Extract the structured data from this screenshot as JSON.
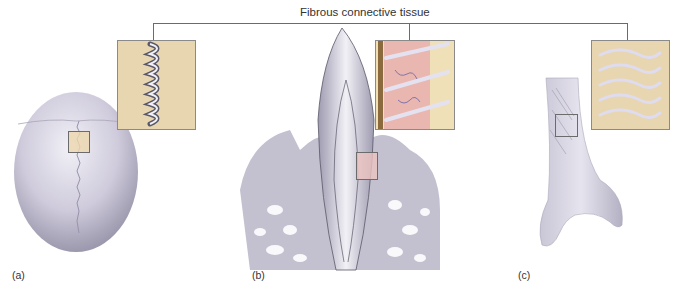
{
  "figure": {
    "title": "Fibrous connective tissue",
    "panels": [
      {
        "id": "a",
        "label": "(a)",
        "subject": "skull-suture"
      },
      {
        "id": "b",
        "label": "(b)",
        "subject": "tooth-gomphosis"
      },
      {
        "id": "c",
        "label": "(c)",
        "subject": "bone-syndesmosis"
      }
    ]
  },
  "colors": {
    "bone": "#d6d3e0",
    "bone_shadow": "#a9a6b8",
    "inset_tan": "#e7d4ae",
    "inset_pink": "#e9b7b0",
    "fiber": "#ececf5",
    "leader_line": "#6b6b6b"
  }
}
